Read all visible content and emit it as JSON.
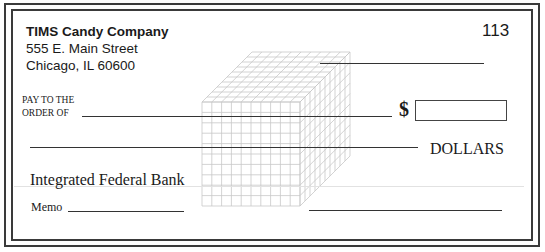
{
  "check": {
    "company_name": "TIMS Candy Company",
    "address_line1": "555 E. Main Street",
    "address_line2": "Chicago, IL 60600",
    "check_number": "113",
    "pay_to_line1": "PAY TO THE",
    "pay_to_line2": "ORDER OF",
    "payee_value": "",
    "currency_symbol": "$",
    "amount_value": "",
    "written_amount_value": "",
    "dollars_label": "DOLLARS",
    "bank_name": "Integrated Federal Bank",
    "memo_label": "Memo",
    "memo_value": "",
    "date_value": "",
    "signature_value": ""
  },
  "watermark": {
    "icon": "cube-grid-icon",
    "grid_color": "#c8c8c8"
  }
}
